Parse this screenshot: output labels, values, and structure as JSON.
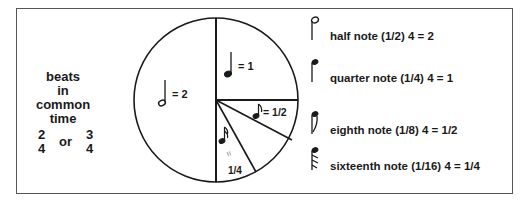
{
  "left_label": {
    "lines": [
      "beats",
      "in",
      "common",
      "time"
    ],
    "time_sig_a": {
      "top": "2",
      "bottom": "4"
    },
    "or": "or",
    "time_sig_b": {
      "top": "3",
      "bottom": "4"
    }
  },
  "pie": {
    "slices": [
      {
        "note": "half-note",
        "label": "= 2",
        "fraction": "1/2"
      },
      {
        "note": "quarter-note",
        "label": "= 1",
        "fraction": "1/4"
      },
      {
        "note": "eighth-note",
        "label": "= 1/2",
        "fraction": "1/8"
      },
      {
        "note": "sixteenth-note",
        "label_eq": "=",
        "label_val": "1/4",
        "fraction": "1/16"
      },
      {
        "note": "sixteenth-note-empty",
        "fraction": "1/16"
      }
    ]
  },
  "legend": [
    {
      "icon": "half-note-icon",
      "text": "half note (1/2) 4 = 2"
    },
    {
      "icon": "quarter-note-icon",
      "text": "quarter note (1/4) 4 = 1"
    },
    {
      "icon": "eighth-note-icon",
      "text": "eighth note (1/8) 4 = 1/2"
    },
    {
      "icon": "sixteenth-note-icon",
      "text": "sixteenth note (1/16) 4 = 1/4"
    }
  ],
  "colors": {
    "ink": "#1a1a1a",
    "frame": "#555555",
    "background": "#ffffff"
  }
}
